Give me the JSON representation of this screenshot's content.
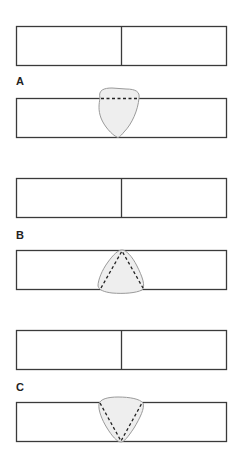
{
  "figure": {
    "panels": [
      {
        "label": "A",
        "description": "Fragment with dashed horizontal line near top edge",
        "dashed_pattern": "horizontal-line"
      },
      {
        "label": "B",
        "description": "Fragment with dashed inverted-V (apex at top)",
        "dashed_pattern": "apex-up-triangle"
      },
      {
        "label": "C",
        "description": "Fragment with dashed V (apex at bottom)",
        "dashed_pattern": "apex-down-triangle"
      }
    ],
    "colors": {
      "stroke": "#3a3a3a",
      "blob_fill": "#eeeeee",
      "blob_stroke": "#9a9a9a",
      "dash": "#222222"
    }
  }
}
